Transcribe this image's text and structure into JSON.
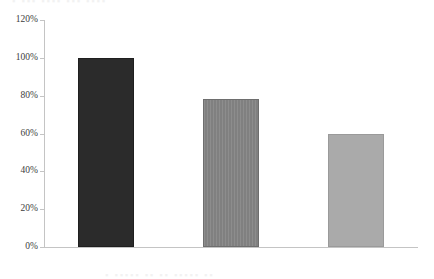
{
  "figure": {
    "background": "#ffffff",
    "top_text_fragment": "▪ ▪▪▪ ▪▪▪▪ ▪▪▪ ▪▪▪▪",
    "bottom_text_fragment": "▪ ▪▪▪▪▪ ▪▪ ▪▪ ▪▪▪▪▪ ▪▪"
  },
  "chart_data": {
    "type": "bar",
    "title": "",
    "subtitle": "",
    "xlabel": "",
    "ylabel": "",
    "categories": [
      "煤炭",
      "石油",
      "天然气"
    ],
    "values": [
      100,
      78,
      60
    ],
    "value_labels": [
      "100%",
      "78%",
      "60%"
    ],
    "ylim": [
      0,
      120
    ],
    "ytick_values": [
      0,
      20,
      40,
      60,
      80,
      100,
      120
    ],
    "ytick_labels": [
      "0%",
      "20%",
      "40%",
      "60%",
      "80%",
      "100%",
      "120%"
    ],
    "grid": false,
    "legend": null,
    "legend_position": "none",
    "orientation": "vertical",
    "bar_colors": [
      "#2b2b2b",
      "#808080",
      "#aaaaaa"
    ],
    "bar_edge_colors": [
      "#1f1f1f",
      "#6e6e6e",
      "#9a9a9a"
    ],
    "axis_color": "#c4c4c4",
    "tick_label_color": "#3d3d3d"
  }
}
